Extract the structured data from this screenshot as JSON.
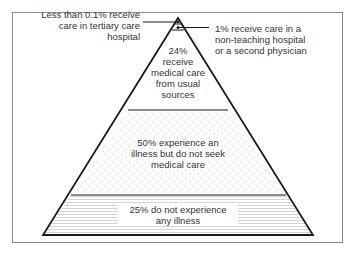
{
  "diagram": {
    "type": "pyramid",
    "levels": [
      {
        "id": "tertiary",
        "text": "Less than 0.1% receive care in tertiary care hospital",
        "lines": [
          "Less than 0.1% receive",
          "care in tertiary care",
          "hospital"
        ],
        "pattern": "solid-dot"
      },
      {
        "id": "non-teaching",
        "text": "1% receive care in a non-teaching hospital or a second physician",
        "lines": [
          "1% receive care in a",
          "non-teaching hospital",
          "or a second physician"
        ],
        "pattern": "dark-fill"
      },
      {
        "id": "usual-sources",
        "text": "24% receive medical care from usual sources",
        "lines": [
          "24%",
          "receive",
          "medical care",
          "from usual",
          "sources"
        ],
        "pattern": "white"
      },
      {
        "id": "no-care",
        "text": "50% experience an illness but do not seek medical care",
        "lines": [
          "50% experience an",
          "illness but do not seek",
          "medical care"
        ],
        "pattern": "stipple"
      },
      {
        "id": "no-illness",
        "text": "25% do not experience any illness",
        "lines": [
          "25% do not experience",
          "any illness"
        ],
        "pattern": "horizontal-lines"
      }
    ],
    "colors": {
      "outline": "#1a1a1a",
      "frame": "#8a8a8a",
      "stipple": "#bdbdbd",
      "hatch": "#c8c8c8"
    }
  }
}
